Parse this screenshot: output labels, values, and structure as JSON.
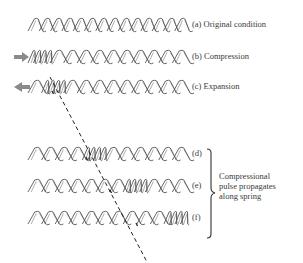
{
  "diagram": {
    "rows": [
      {
        "id": "a",
        "label": "(a)  Original condition",
        "y": 25,
        "arrow": "none",
        "compressed_start": 0,
        "compressed_end": 0
      },
      {
        "id": "b",
        "label": "(b)  Compression",
        "y": 57,
        "arrow": "right",
        "compressed_start": 0,
        "compressed_end": 4
      },
      {
        "id": "c",
        "label": "(c)  Expansion",
        "y": 87,
        "arrow": "left",
        "compressed_start": 1,
        "compressed_end": 5
      },
      {
        "id": "d",
        "label": "(d)",
        "y": 154,
        "arrow": "none",
        "compressed_start": 4,
        "compressed_end": 8
      },
      {
        "id": "e",
        "label": "(e)",
        "y": 186,
        "arrow": "none",
        "compressed_start": 7,
        "compressed_end": 11
      },
      {
        "id": "f",
        "label": "(f)",
        "y": 218,
        "arrow": "none",
        "compressed_start": 10,
        "compressed_end": 14
      }
    ],
    "brace_note": [
      "Compressional",
      "pulse propagates",
      "along spring"
    ],
    "colors": {
      "coil": "#555555",
      "arrow": "#8a8a8a",
      "dash": "#222222"
    }
  }
}
